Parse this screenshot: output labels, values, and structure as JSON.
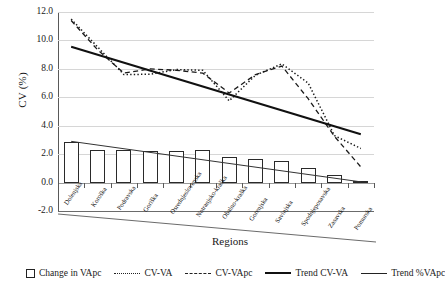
{
  "chart_data": {
    "type": "line",
    "title": "",
    "xlabel": "Regions",
    "ylabel": "CV (%)",
    "ylim": [
      -2.0,
      12.0
    ],
    "ytick_labels": [
      "12.0",
      "10.0",
      "8.0",
      "6.0",
      "4.0",
      "2.0",
      "0.0",
      "-2.0"
    ],
    "ytick_values": [
      12.0,
      10.0,
      8.0,
      6.0,
      4.0,
      2.0,
      0.0,
      -2.0
    ],
    "grid": true,
    "legend_position": "bottom",
    "categories": [
      "Dolenjska",
      "Koroška",
      "Podravska",
      "Goriška",
      "Osrednjeslovenska",
      "Notranjsko-kraška",
      "Obalno-kraška",
      "Gorenjska",
      "Savinjska",
      "Spodnjeposavska",
      "Zasavska",
      "Pomurska"
    ],
    "series": [
      {
        "name": "Change in VApc",
        "type": "bar",
        "values": [
          2.85,
          2.3,
          2.3,
          2.22,
          2.22,
          2.3,
          1.8,
          1.65,
          1.5,
          1.05,
          0.55,
          0.08
        ]
      },
      {
        "name": "CV-VA",
        "type": "line",
        "style": "dotted",
        "values": [
          11.5,
          9.55,
          7.6,
          7.62,
          7.95,
          7.9,
          5.75,
          7.55,
          8.35,
          7.0,
          3.3,
          2.4
        ]
      },
      {
        "name": "CV-VApc",
        "type": "line",
        "style": "dashed",
        "values": [
          11.4,
          9.35,
          7.7,
          8.0,
          7.9,
          7.7,
          6.3,
          7.6,
          8.2,
          5.9,
          3.25,
          1.1
        ]
      },
      {
        "name": "Trend CV-VA",
        "type": "trend",
        "style": "solid-thick",
        "start_value": 9.55,
        "end_value": 3.4
      },
      {
        "name": "Trend %VApc",
        "type": "trend",
        "style": "solid-thin",
        "start_value": 2.9,
        "end_value": 0.05
      }
    ]
  },
  "axes": {
    "y_title": "CV (%)",
    "x_title": "Regions"
  },
  "legend": {
    "items": [
      {
        "label": "Change in VApc",
        "marker": "box-swatch"
      },
      {
        "label": "CV-VA",
        "marker": "dotted-line"
      },
      {
        "label": "CV-VApc",
        "marker": "dashed-line"
      },
      {
        "label": "Trend CV-VA",
        "marker": "thick-solid-line"
      },
      {
        "label": "Trend %VApc",
        "marker": "thin-solid-line"
      }
    ]
  },
  "colors": {
    "axis": "#595959",
    "grid": "#d6d6d6",
    "series": "#1a1a1a",
    "background": "#ffffff"
  }
}
